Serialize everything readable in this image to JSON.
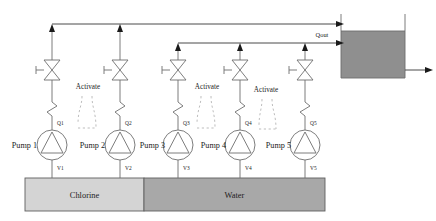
{
  "diagram": {
    "colors": {
      "line": "#6e6e6e",
      "line_dark": "#4a4a4a",
      "arrow": "#1a1a1a",
      "dashed": "#b5b5b5",
      "chlorine_fill": "#d4d4d4",
      "water_fill": "#a8a8a8",
      "tank_fill": "#8f8f8f",
      "background": "#ffffff"
    },
    "pumps": [
      {
        "name": "Pump 1",
        "flow_label": "Q1",
        "valve_label": "V1",
        "cx": 52,
        "source": "Chlorine",
        "header": "upper"
      },
      {
        "name": "Pump 2",
        "flow_label": "Q2",
        "valve_label": "V2",
        "cx": 120,
        "source": "Chlorine",
        "header": "upper"
      },
      {
        "name": "Pump 3",
        "flow_label": "Q3",
        "valve_label": "V3",
        "cx": 178,
        "source": "Water",
        "header": "lower"
      },
      {
        "name": "Pump 4",
        "flow_label": "Q4",
        "valve_label": "V4",
        "cx": 240,
        "source": "Water",
        "header": "lower"
      },
      {
        "name": "Pump 5",
        "flow_label": "Q5",
        "valve_label": "V5",
        "cx": 305,
        "source": "Water",
        "header": "lower"
      }
    ],
    "activate_labels": [
      {
        "text": "Activate",
        "x": 88,
        "y": 89
      },
      {
        "text": "Activate",
        "x": 207,
        "y": 89
      },
      {
        "text": "Activate",
        "x": 266,
        "y": 92
      }
    ],
    "reservoirs": [
      {
        "label": "Chlorine",
        "x": 25,
        "width": 119,
        "fill": "#d4d4d4"
      },
      {
        "label": "Water",
        "x": 144,
        "width": 181,
        "fill": "#a8a8a8"
      }
    ],
    "tank": {
      "label": "",
      "outlet_flow_label": "Qout",
      "x": 340,
      "y": 14,
      "width": 66,
      "height": 64,
      "liquid_level_y": 31,
      "fill": "#8f8f8f"
    },
    "headers": [
      {
        "id": "upper",
        "y": 24,
        "x_start": 52,
        "x_end": 340
      },
      {
        "id": "lower",
        "y": 43,
        "x_start": 178,
        "x_end": 340
      }
    ]
  }
}
